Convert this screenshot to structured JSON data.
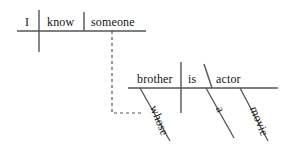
{
  "diagram": {
    "type": "reed-kellogg-sentence-diagram",
    "sentence": "I know someone whose brother is a movie actor",
    "stroke_color": "#555555",
    "text_color": "#141414",
    "background_color": "#ffffff",
    "clauses": [
      {
        "id": "main-clause",
        "baseline": {
          "x1": 17,
          "y1": 31,
          "x2": 146,
          "y2": 31
        },
        "words": [
          {
            "id": "w-i",
            "role": "subject",
            "text": "I"
          },
          {
            "id": "w-know",
            "role": "verb",
            "text": "know"
          },
          {
            "id": "w-someone",
            "role": "direct-object",
            "text": "someone"
          }
        ],
        "dividers": [
          {
            "kind": "subject-verb",
            "x": 39,
            "y1": 10,
            "y2": 52
          },
          {
            "kind": "verb-object",
            "x": 84,
            "y1": 12,
            "y2": 31
          }
        ]
      },
      {
        "id": "relative-clause",
        "baseline": {
          "x1": 128,
          "y1": 88,
          "x2": 278,
          "y2": 88
        },
        "words": [
          {
            "id": "w-brother",
            "role": "subject",
            "text": "brother"
          },
          {
            "id": "w-is",
            "role": "linking-verb",
            "text": "is"
          },
          {
            "id": "w-actor",
            "role": "predicate-nominative",
            "text": "actor"
          }
        ],
        "dividers": [
          {
            "kind": "subject-verb",
            "x": 181,
            "y1": 62,
            "y2": 113
          },
          {
            "kind": "predicate-nominative-slant",
            "x1": 204,
            "y1": 64,
            "x2": 212,
            "y2": 88
          }
        ],
        "modifiers": [
          {
            "id": "w-whose",
            "text": "whose",
            "attaches_to": "brother",
            "slant": {
              "x1": 140,
              "y1": 88,
              "x2": 170,
              "y2": 140
            }
          },
          {
            "id": "w-a",
            "text": "a",
            "attaches_to": "actor",
            "slant": {
              "x1": 206,
              "y1": 88,
              "x2": 234,
              "y2": 138
            }
          },
          {
            "id": "w-movie",
            "text": "movie",
            "attaches_to": "actor",
            "slant": {
              "x1": 240,
              "y1": 88,
              "x2": 268,
              "y2": 140
            }
          }
        ]
      }
    ],
    "connector": {
      "kind": "dashed-relative-pronoun-link",
      "from": "someone",
      "to": "whose",
      "path": "M 112 31 L 112 113 L 141 113",
      "dash_pattern": "3,3"
    }
  }
}
